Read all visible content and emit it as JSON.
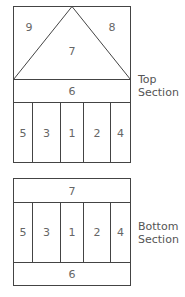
{
  "top_section": {
    "label_line1": "Top",
    "label_line2": "Section",
    "triangle_regions": {
      "left": "9",
      "center": "7",
      "right": "8"
    },
    "band": "6",
    "columns": [
      "5",
      "3",
      "1",
      "2",
      "4"
    ]
  },
  "bottom_section": {
    "label_line1": "Bottom",
    "label_line2": "Section",
    "top_band": "7",
    "columns": [
      "5",
      "3",
      "1",
      "2",
      "4"
    ],
    "bottom_band": "6"
  }
}
